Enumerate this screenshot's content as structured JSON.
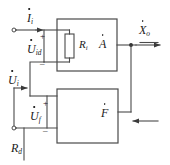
{
  "diagram": {
    "stroke_color": "#4a4a4a",
    "text_color": "#1a1a1a",
    "background": "#ffffff"
  },
  "labels": {
    "input_current": {
      "symbol": "I",
      "subscript": "i",
      "dot": true
    },
    "differential_voltage": {
      "symbol": "U",
      "subscript": "id",
      "dot": true
    },
    "input_voltage": {
      "symbol": "U",
      "subscript": "i",
      "dot": true
    },
    "feedback_voltage": {
      "symbol": "U",
      "subscript": "f",
      "dot": true
    },
    "source_resistance": {
      "symbol": "R",
      "subscript": "d",
      "dot": false
    },
    "input_resistance": {
      "symbol": "R",
      "subscript": "i",
      "dot": false
    },
    "amplifier_block": {
      "symbol": "A",
      "subscript": "",
      "dot": true
    },
    "feedback_block": {
      "symbol": "F",
      "subscript": "",
      "dot": true
    },
    "output_signal": {
      "symbol": "X",
      "subscript": "o",
      "dot": true
    }
  },
  "polarity": {
    "top_plus": "+",
    "top_minus": "_",
    "bottom_plus": "+",
    "bottom_minus": "_"
  },
  "nodes": {
    "input_terminal_top": "open-terminal",
    "input_terminal_bottom": "open-terminal",
    "output_junction": "junction-dot"
  }
}
